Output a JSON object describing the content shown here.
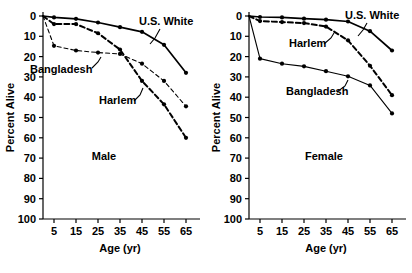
{
  "figure": {
    "background": "#ffffff",
    "ink": "#000000",
    "panel_count": 2
  },
  "chart_data": [
    {
      "type": "line",
      "title": "",
      "panel_label": "Male",
      "xlabel": "Age (yr)",
      "ylabel": "Percent Alive",
      "xlim": [
        0,
        70
      ],
      "ylim": [
        0,
        100
      ],
      "xticks": [
        5,
        15,
        25,
        35,
        45,
        55,
        65
      ],
      "yticks": [
        0,
        10,
        20,
        30,
        40,
        50,
        60,
        70,
        80,
        90,
        100
      ],
      "grid": false,
      "legend": "inline-annotations",
      "x": [
        0,
        5,
        15,
        25,
        35,
        45,
        55,
        65
      ],
      "series": [
        {
          "name": "U.S. White",
          "style": "solid",
          "marker": "filled-circle",
          "values": [
            100,
            99.3,
            98.6,
            96.8,
            94.5,
            92.2,
            85.8,
            72.0
          ]
        },
        {
          "name": "Harlem",
          "style": "dashed-heavy",
          "marker": "filled-circle",
          "values": [
            100,
            96.0,
            96.0,
            91.5,
            83.5,
            68.0,
            56.5,
            40.0
          ]
        },
        {
          "name": "Bangladesh",
          "style": "dashed-thin",
          "marker": "filled-circle",
          "values": [
            100,
            85.3,
            83.0,
            82.0,
            81.3,
            76.5,
            68.0,
            55.5
          ]
        }
      ]
    },
    {
      "type": "line",
      "title": "",
      "panel_label": "Female",
      "xlabel": "Age (yr)",
      "ylabel": "Percent Alive",
      "xlim": [
        0,
        70
      ],
      "ylim": [
        0,
        100
      ],
      "xticks": [
        5,
        15,
        25,
        35,
        45,
        55,
        65
      ],
      "yticks": [
        0,
        10,
        20,
        30,
        40,
        50,
        60,
        70,
        80,
        90,
        100
      ],
      "grid": false,
      "legend": "inline-annotations",
      "x": [
        0,
        5,
        15,
        25,
        35,
        45,
        55,
        65
      ],
      "series": [
        {
          "name": "U.S. White",
          "style": "solid",
          "marker": "filled-circle",
          "values": [
            100,
            99.5,
            99.3,
            98.7,
            98.2,
            97.3,
            92.5,
            83.0
          ]
        },
        {
          "name": "Harlem",
          "style": "dashed-heavy",
          "marker": "filled-circle",
          "values": [
            100,
            97.5,
            97.0,
            96.5,
            94.8,
            88.0,
            75.5,
            61.0
          ]
        },
        {
          "name": "Bangladesh",
          "style": "solid-thin",
          "marker": "filled-circle",
          "values": [
            100,
            79.0,
            76.5,
            75.2,
            72.8,
            70.3,
            65.8,
            52.0
          ]
        }
      ]
    }
  ],
  "panels": [
    {
      "id": "male",
      "label": "Male",
      "axis": {
        "x_title": "Age (yr)",
        "y_title": "Percent Alive"
      },
      "annotations": [
        {
          "name": "us-white",
          "text": "U.S. White"
        },
        {
          "name": "harlem",
          "text": "Harlem"
        },
        {
          "name": "bangladesh",
          "text": "Bangladesh"
        }
      ],
      "ytick_labels": [
        "100",
        "90",
        "80",
        "70",
        "60",
        "50",
        "40",
        "30",
        "20",
        "10",
        "0"
      ],
      "xtick_labels": [
        "5",
        "15",
        "25",
        "35",
        "45",
        "55",
        "65"
      ]
    },
    {
      "id": "female",
      "label": "Female",
      "axis": {
        "x_title": "Age (yr)",
        "y_title": "Percent Alive"
      },
      "annotations": [
        {
          "name": "us-white",
          "text": "U.S. White"
        },
        {
          "name": "harlem",
          "text": "Harlem"
        },
        {
          "name": "bangladesh",
          "text": "Bangladesh"
        }
      ],
      "ytick_labels": [
        "100",
        "90",
        "80",
        "70",
        "60",
        "50",
        "40",
        "30",
        "20",
        "10",
        "0"
      ],
      "xtick_labels": [
        "5",
        "15",
        "25",
        "35",
        "45",
        "55",
        "65"
      ]
    }
  ]
}
